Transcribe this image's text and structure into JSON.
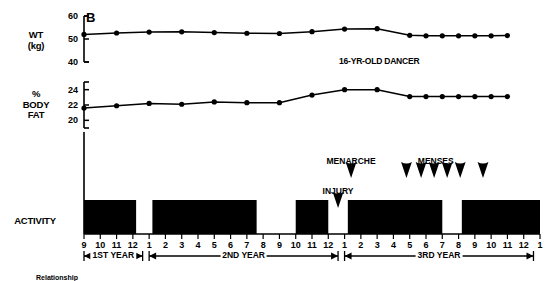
{
  "panel": {
    "letter": "B",
    "subject_label": "16-YR-OLD DANCER"
  },
  "axes": {
    "weight": {
      "label_line1": "WT",
      "label_line2": "(kg)",
      "ticks": [
        60,
        50,
        40
      ]
    },
    "bodyfat": {
      "label_line1": "%",
      "label_line2": "BODY",
      "label_line3": "FAT",
      "ticks": [
        24,
        22,
        20
      ]
    },
    "activity": {
      "label": "ACTIVITY"
    }
  },
  "annotations": {
    "menarche": "MENARCHE",
    "injury": "INJURY",
    "menses": "MENSES"
  },
  "year_brackets": [
    {
      "label": "1ST YEAR"
    },
    {
      "label": "2ND YEAR"
    },
    {
      "label": "3RD YEAR"
    }
  ],
  "caption": "Relationship",
  "chart_data": {
    "type": "line",
    "title": "16-YR-OLD DANCER",
    "xlabel": "",
    "grid": false,
    "legend": "none",
    "x_tick_labels": [
      "9",
      "10",
      "11",
      "12",
      "1",
      "2",
      "3",
      "4",
      "5",
      "6",
      "7",
      "8",
      "9",
      "10",
      "11",
      "12",
      "1",
      "2",
      "3",
      "4",
      "5",
      "6",
      "7",
      "8",
      "9",
      "10",
      "11",
      "12",
      "1"
    ],
    "x_months": [
      9,
      10,
      11,
      12,
      1,
      2,
      3,
      4,
      5,
      6,
      7,
      8,
      9,
      10,
      11,
      12,
      1,
      2,
      3,
      4,
      5,
      6,
      7,
      8,
      9,
      10,
      11,
      12,
      1
    ],
    "panels": [
      {
        "name": "weight",
        "ylabel": "WT (kg)",
        "ylim": [
          40,
          60
        ],
        "yticks": [
          40,
          50,
          60
        ],
        "units": "kg",
        "points": [
          {
            "x_index": 0,
            "x_label": "9",
            "y": 52.0
          },
          {
            "x_index": 2,
            "x_label": "11",
            "y": 52.6
          },
          {
            "x_index": 4,
            "x_label": "1",
            "y": 53.0
          },
          {
            "x_index": 6,
            "x_label": "3",
            "y": 53.1
          },
          {
            "x_index": 8,
            "x_label": "5",
            "y": 52.8
          },
          {
            "x_index": 10,
            "x_label": "7",
            "y": 52.5
          },
          {
            "x_index": 12,
            "x_label": "9",
            "y": 52.4
          },
          {
            "x_index": 14,
            "x_label": "11",
            "y": 53.2
          },
          {
            "x_index": 16,
            "x_label": "1",
            "y": 54.3
          },
          {
            "x_index": 18,
            "x_label": "3",
            "y": 54.5
          },
          {
            "x_index": 20,
            "x_label": "5",
            "y": 51.6
          },
          {
            "x_index": 21,
            "x_label": "6",
            "y": 51.4
          },
          {
            "x_index": 22,
            "x_label": "7",
            "y": 51.4
          },
          {
            "x_index": 23,
            "x_label": "8",
            "y": 51.4
          },
          {
            "x_index": 24,
            "x_label": "9",
            "y": 51.4
          },
          {
            "x_index": 25,
            "x_label": "10",
            "y": 51.4
          },
          {
            "x_index": 26,
            "x_label": "11",
            "y": 51.5
          }
        ]
      },
      {
        "name": "body_fat",
        "ylabel": "% BODY FAT",
        "ylim": [
          19,
          25
        ],
        "yticks": [
          20,
          22,
          24
        ],
        "units": "%",
        "points": [
          {
            "x_index": 0,
            "x_label": "9",
            "y": 21.6
          },
          {
            "x_index": 2,
            "x_label": "11",
            "y": 21.9
          },
          {
            "x_index": 4,
            "x_label": "1",
            "y": 22.2
          },
          {
            "x_index": 6,
            "x_label": "3",
            "y": 22.1
          },
          {
            "x_index": 8,
            "x_label": "5",
            "y": 22.4
          },
          {
            "x_index": 10,
            "x_label": "7",
            "y": 22.3
          },
          {
            "x_index": 12,
            "x_label": "9",
            "y": 22.3
          },
          {
            "x_index": 14,
            "x_label": "11",
            "y": 23.3
          },
          {
            "x_index": 16,
            "x_label": "1",
            "y": 24.0
          },
          {
            "x_index": 18,
            "x_label": "3",
            "y": 24.0
          },
          {
            "x_index": 20,
            "x_label": "5",
            "y": 23.1
          },
          {
            "x_index": 21,
            "x_label": "6",
            "y": 23.1
          },
          {
            "x_index": 22,
            "x_label": "7",
            "y": 23.1
          },
          {
            "x_index": 23,
            "x_label": "8",
            "y": 23.1
          },
          {
            "x_index": 24,
            "x_label": "9",
            "y": 23.1
          },
          {
            "x_index": 25,
            "x_label": "10",
            "y": 23.1
          },
          {
            "x_index": 26,
            "x_label": "11",
            "y": 23.1
          }
        ]
      }
    ],
    "activity_bars": [
      {
        "start_index": 0.0,
        "end_index": 3.2,
        "active": true
      },
      {
        "start_index": 4.2,
        "end_index": 10.6,
        "active": true
      },
      {
        "start_index": 13.0,
        "end_index": 15.0,
        "active": true
      },
      {
        "start_index": 16.2,
        "end_index": 22.0,
        "active": true
      },
      {
        "start_index": 23.2,
        "end_index": 28.0,
        "active": true
      }
    ],
    "event_markers": [
      {
        "label": "INJURY",
        "x_index": 15.6,
        "level": "low"
      },
      {
        "label": "MENARCHE",
        "x_index": 16.4,
        "level": "high"
      },
      {
        "label": "MENSES",
        "x_index": 19.8,
        "level": "high"
      },
      {
        "label": "MENSES",
        "x_index": 20.7,
        "level": "high"
      },
      {
        "label": "MENSES",
        "x_index": 21.5,
        "level": "high"
      },
      {
        "label": "MENSES",
        "x_index": 22.3,
        "level": "high"
      },
      {
        "label": "MENSES",
        "x_index": 23.1,
        "level": "high"
      },
      {
        "label": "MENSES",
        "x_index": 24.5,
        "level": "high"
      }
    ]
  }
}
